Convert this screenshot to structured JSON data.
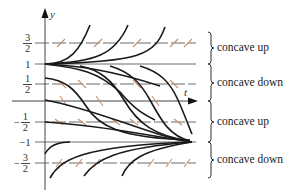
{
  "figure": {
    "type": "slope field with solution curves",
    "axes": {
      "x_label": "t",
      "y_label": "y"
    },
    "y_tick_labels": [
      {
        "value": 1.5,
        "text_num": "3",
        "text_den": "2",
        "sign": ""
      },
      {
        "value": 1,
        "text": "1"
      },
      {
        "value": 0.5,
        "text_num": "1",
        "text_den": "2",
        "sign": ""
      },
      {
        "value": -0.5,
        "text_num": "1",
        "text_den": "2",
        "sign": "−"
      },
      {
        "value": -1,
        "text": "−1"
      },
      {
        "value": -1.5,
        "text_num": "3",
        "text_den": "2",
        "sign": "−"
      }
    ],
    "equilibrium_lines": [
      1,
      -1
    ],
    "dashed_lines": [
      1.5,
      0.5,
      -0.5,
      -1.5
    ],
    "regions": [
      {
        "label": "concave up",
        "from": 1,
        "to": 2
      },
      {
        "label": "concave down",
        "from": 0,
        "to": 1
      },
      {
        "label": "concave up",
        "from": -1,
        "to": 0
      },
      {
        "label": "concave down",
        "from": -2,
        "to": -1
      }
    ],
    "colors": {
      "curves": "#1a1a1a",
      "axes": "#444444",
      "guide_lines": "#666666",
      "slope_marks": "#c8906a"
    }
  }
}
